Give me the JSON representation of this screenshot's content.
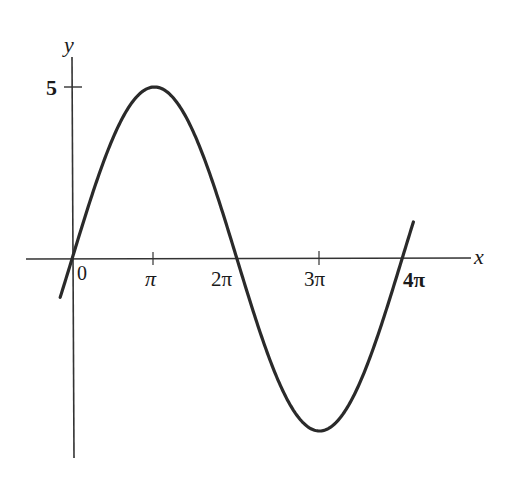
{
  "chart_data": {
    "type": "line",
    "title": "",
    "function": "y = 5 sin(x/2)",
    "xlabel": "x",
    "ylabel": "y",
    "x_ticks": [
      {
        "value": 0,
        "label": "0"
      },
      {
        "value": 3.14159,
        "label": "π"
      },
      {
        "value": 6.28319,
        "label": "2π"
      },
      {
        "value": 9.42478,
        "label": "3π"
      },
      {
        "value": 12.56637,
        "label": "4π"
      }
    ],
    "y_ticks": [
      {
        "value": 5,
        "label": "5"
      }
    ],
    "xlim": [
      -1.7,
      15.3
    ],
    "ylim": [
      -7.0,
      6.0
    ],
    "curve_domain": [
      -0.45,
      13.0
    ],
    "series": [
      {
        "name": "5 sin(x/2)",
        "x": [
          0,
          3.14159,
          6.28319,
          9.42478,
          12.56637
        ],
        "y": [
          0,
          5,
          0,
          -5,
          0
        ]
      }
    ],
    "grid": false,
    "legend": null,
    "colors": {
      "curve": "#2a2a2a",
      "axis": "#333333"
    }
  },
  "labels": {
    "x_axis": "x",
    "y_axis": "y",
    "y_tick_5": "5",
    "x_tick_0": "0",
    "x_tick_pi": "π",
    "x_tick_2pi": "2π",
    "x_tick_3pi": "3π",
    "x_tick_4pi": "4π"
  }
}
